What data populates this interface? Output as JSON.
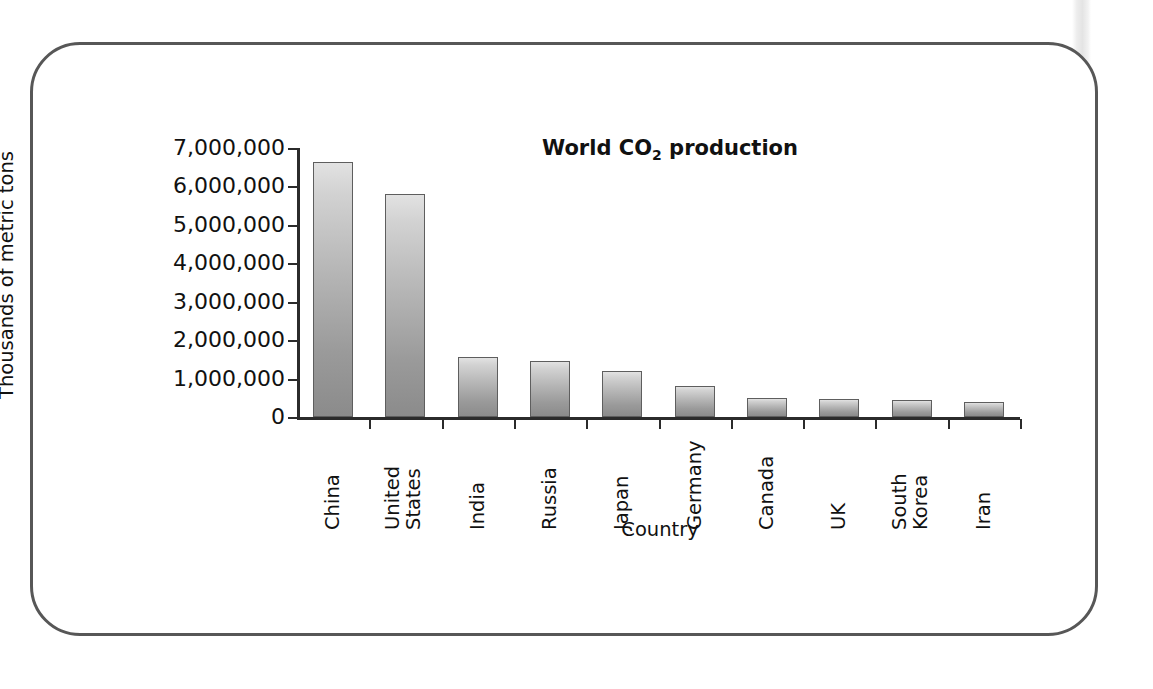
{
  "figure": {
    "frame_border_color": "#575757",
    "background_color": "#ffffff"
  },
  "chart_data": {
    "type": "bar",
    "title": "World CO2 production",
    "title_html": "World CO<sub>2</sub> production",
    "xlabel": "Country",
    "ylabel": "Thousands of metric tons",
    "categories": [
      "China",
      "United States",
      "India",
      "Russia",
      "Japan",
      "Germany",
      "Canada",
      "UK",
      "South Korea",
      "Iran"
    ],
    "category_labels_multiline": [
      "China",
      "United\nStates",
      "India",
      "Russia",
      "Japan",
      "Germany",
      "Canada",
      "UK",
      "South\nKorea",
      "Iran"
    ],
    "values": [
      6630000,
      5800000,
      1560000,
      1470000,
      1200000,
      800000,
      500000,
      470000,
      430000,
      400000
    ],
    "ylim": [
      0,
      7000000
    ],
    "ytick_labels": [
      "7,000,000",
      "6,000,000",
      "5,000,000",
      "4,000,000",
      "3,000,000",
      "2,000,000",
      "1,000,000",
      "0"
    ],
    "ytick_values": [
      7000000,
      6000000,
      5000000,
      4000000,
      3000000,
      2000000,
      1000000,
      0
    ],
    "grid": false,
    "legend": null,
    "bar_fill_top_color": "#e2e2e2",
    "bar_fill_bottom_color": "#8b8b8b",
    "bar_border_color": "#5e5e5e",
    "axis_color": "#2b2b2b",
    "text_color": "#111111"
  }
}
